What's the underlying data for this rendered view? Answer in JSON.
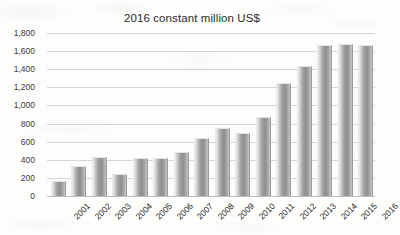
{
  "chart_data": {
    "type": "bar",
    "title": "2016 constant million US$",
    "xlabel": "",
    "ylabel": "",
    "categories": [
      "2001",
      "2002",
      "2003",
      "2004",
      "2005",
      "2006",
      "2007",
      "2008",
      "2009",
      "2010",
      "2011",
      "2012",
      "2013",
      "2014",
      "2015",
      "2016"
    ],
    "values": [
      150,
      320,
      425,
      230,
      405,
      410,
      470,
      630,
      740,
      685,
      860,
      1240,
      1420,
      1660,
      1665,
      1660
    ],
    "ylim": [
      0,
      1800
    ],
    "ytick_step": 200,
    "ytick_labels": [
      "0",
      "200",
      "400",
      "600",
      "800",
      "1,000",
      "1,200",
      "1,400",
      "1,600",
      "1,800"
    ],
    "grid": true,
    "grid_axis": "y",
    "legend": false,
    "bar_color": "#9e9e9e",
    "gridline_color": "#d6d6d6",
    "background_color": "#fdfdfc",
    "text_color": "#2b2b2b",
    "xtick_rotation": -45
  }
}
